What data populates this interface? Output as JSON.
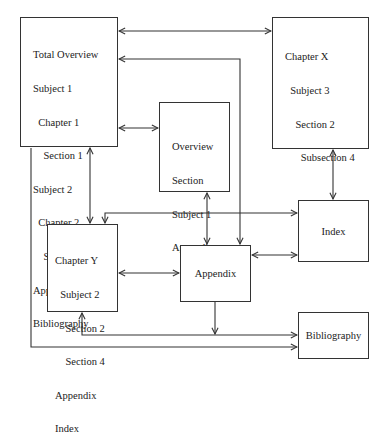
{
  "diagram": {
    "nodes": {
      "total_overview": {
        "lines": [
          "Total Overview",
          "Subject 1",
          "  Chapter 1",
          "    Section 1",
          "Subject 2",
          "  Chapter 2",
          "    Section 2",
          "Appendix",
          "Bibliography"
        ]
      },
      "chapter_x": {
        "lines": [
          "Chapter X",
          "  Subject 3",
          "    Section 2",
          "      Subsection 4"
        ]
      },
      "overview_section": {
        "lines": [
          "Overview",
          "Section",
          "Subject 1",
          "Appendix"
        ]
      },
      "index": {
        "label": "Index"
      },
      "chapter_y": {
        "lines": [
          "Chapter Y",
          "  Subject 2",
          "    Section 2",
          "    Section 4",
          "Appendix",
          "Index"
        ]
      },
      "appendix": {
        "label": "Appendix"
      },
      "bibliography": {
        "label": "Bibliography"
      }
    },
    "edges": [
      {
        "from": "Total Overview",
        "to": "Chapter X",
        "direction": "bidirectional"
      },
      {
        "from": "Appendix",
        "to": "Total Overview",
        "direction": "to"
      },
      {
        "from": "Total Overview",
        "to": "Overview Section",
        "direction": "bidirectional"
      },
      {
        "from": "Total Overview",
        "to": "Chapter Y",
        "direction": "bidirectional"
      },
      {
        "from": "Chapter X",
        "to": "Index",
        "direction": "bidirectional"
      },
      {
        "from": "Index",
        "to": "Chapter Y",
        "direction": "bidirectional"
      },
      {
        "from": "Overview Section",
        "to": "Appendix",
        "direction": "bidirectional"
      },
      {
        "from": "Chapter Y",
        "to": "Appendix",
        "direction": "bidirectional"
      },
      {
        "from": "Appendix",
        "to": "Index",
        "direction": "bidirectional"
      },
      {
        "from": "Appendix",
        "to": "Bibliography",
        "direction": "to"
      },
      {
        "from": "Chapter Y",
        "to": "Bibliography",
        "direction": "bidirectional"
      },
      {
        "from": "Total Overview",
        "to": "Bibliography",
        "direction": "to"
      }
    ]
  }
}
